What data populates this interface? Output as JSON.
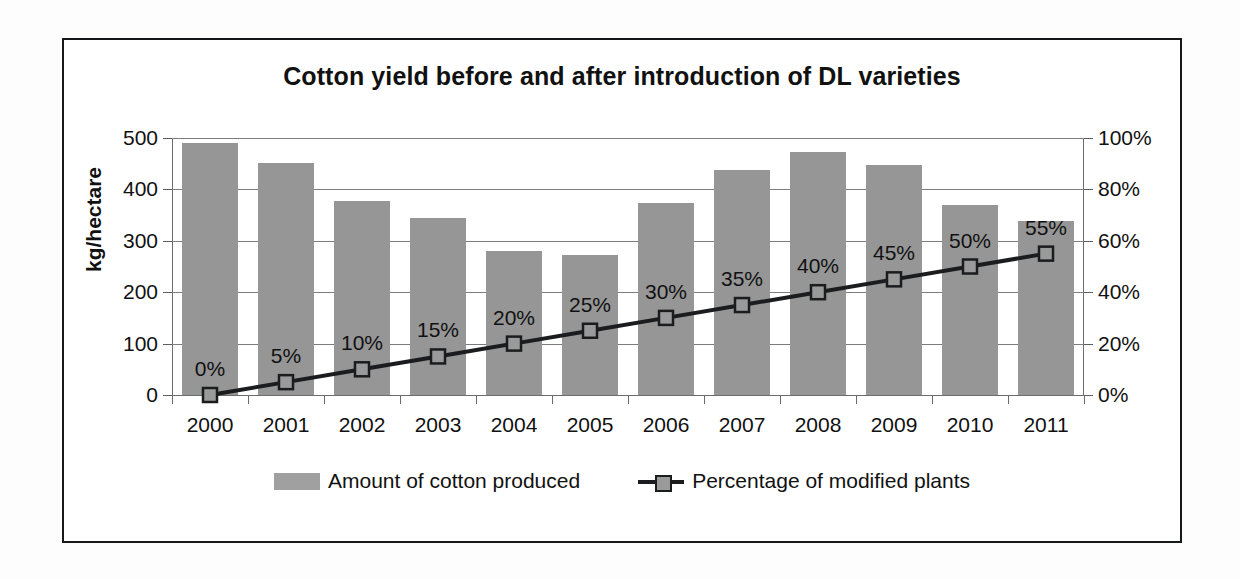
{
  "chart_data": {
    "type": "bar",
    "title": "Cotton yield before and after introduction of DL varieties",
    "xlabel": "",
    "ylabel": "kg/hectare",
    "y2label": "",
    "categories": [
      "2000",
      "2001",
      "2002",
      "2003",
      "2004",
      "2005",
      "2006",
      "2007",
      "2008",
      "2009",
      "2010",
      "2011"
    ],
    "ylim": [
      0,
      500
    ],
    "y_ticks": [
      0,
      100,
      200,
      300,
      400,
      500
    ],
    "y_tick_labels": [
      "0",
      "100",
      "200",
      "300",
      "400",
      "500"
    ],
    "y2lim": [
      0,
      100
    ],
    "y2_ticks": [
      0,
      20,
      40,
      60,
      80,
      100
    ],
    "y2_tick_labels": [
      "0%",
      "20%",
      "40%",
      "60%",
      "80%",
      "100%"
    ],
    "grid": true,
    "legend_position": "bottom",
    "series": [
      {
        "name": "Amount of cotton produced",
        "type": "bar",
        "axis": "left",
        "unit": "kg/hectare",
        "color": "#969696",
        "values": [
          490,
          452,
          377,
          345,
          280,
          273,
          373,
          438,
          472,
          447,
          370,
          339
        ]
      },
      {
        "name": "Percentage of modified plants",
        "type": "line",
        "axis": "right",
        "unit": "%",
        "color": "#1b1c1e",
        "marker": "square",
        "values": [
          0,
          5,
          10,
          15,
          20,
          25,
          30,
          35,
          40,
          45,
          50,
          55
        ],
        "data_labels": [
          "0%",
          "5%",
          "10%",
          "15%",
          "20%",
          "25%",
          "30%",
          "35%",
          "40%",
          "45%",
          "50%",
          "55%"
        ]
      }
    ]
  },
  "legend": {
    "bar_label": "Amount of cotton produced",
    "line_label": "Percentage of modified plants"
  }
}
